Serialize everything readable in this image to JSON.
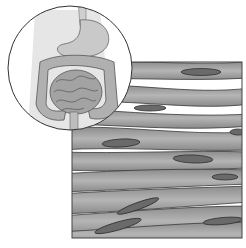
{
  "illustration": {
    "subject": "smooth muscle tissue",
    "inset_subject": "digestive system (stomach and intestines)",
    "colors": {
      "background": "#ffffff",
      "fiber_fill": "#9a9a9a",
      "fiber_light": "#b8b8b8",
      "nucleus_fill": "#6e6e6e",
      "outline": "#333333",
      "gap": "#ffffff"
    }
  }
}
